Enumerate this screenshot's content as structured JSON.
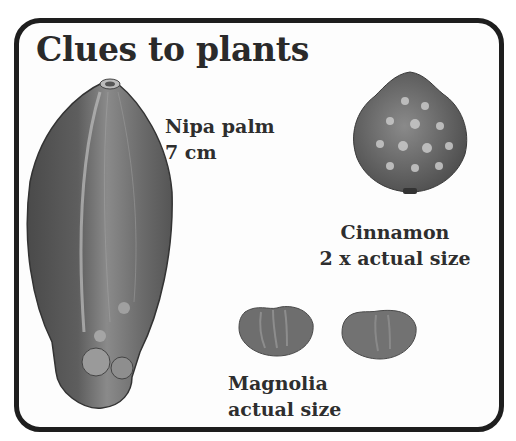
{
  "title": "Clues to plants",
  "specimens": [
    {
      "name": "Nipa palm",
      "scale": "7 cm"
    },
    {
      "name": "Cinnamon",
      "scale": "2 x actual size"
    },
    {
      "name": "Magnolia",
      "scale": "actual size"
    }
  ],
  "colors": {
    "border": "#1e1e1e",
    "text": "#2e2e2e",
    "seed": "#6a6a6a"
  }
}
